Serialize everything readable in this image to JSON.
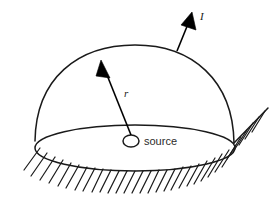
{
  "figure": {
    "background_color": "#ffffff",
    "ink_color": "#1a1a1a",
    "width": 276,
    "height": 209
  },
  "labels": {
    "intensity": "I",
    "radius": "r",
    "source": "source"
  },
  "geometry": {
    "dome": {
      "apex_x": 135,
      "apex_y": 45,
      "left_base_x": 35,
      "left_base_y": 141,
      "right_base_x": 234,
      "right_base_y": 143
    },
    "base_ellipse": {
      "cx": 135,
      "cy": 148,
      "rx": 100,
      "ry": 23
    },
    "source_marker": {
      "cx": 131,
      "cy": 141,
      "rx": 8,
      "ry": 6
    },
    "radius_arrow": {
      "from_x": 131,
      "from_y": 135,
      "to_x": 101,
      "to_y": 60
    },
    "intensity_arrow": {
      "from_x": 177,
      "from_y": 51,
      "to_x": 192,
      "to_y": 12
    },
    "ground_hatch_count": 31
  },
  "label_positions": {
    "intensity": {
      "x": 200,
      "y": 20
    },
    "radius": {
      "x": 124,
      "y": 97
    },
    "source": {
      "x": 144,
      "y": 145
    }
  }
}
